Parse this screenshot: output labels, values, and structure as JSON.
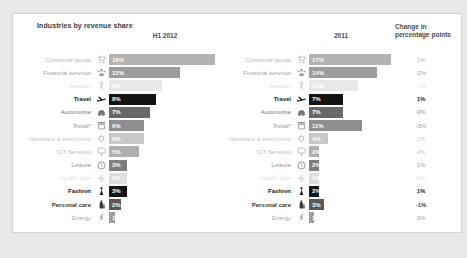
{
  "page": {
    "background": "#e9e9e9",
    "panel_background": "#ffffff",
    "panel_border": "#d2d2d2"
  },
  "title": "Industries by revenue share",
  "headers": {
    "col_2012": "H1 2012",
    "col_2011": "2011",
    "change_line1": "Change in",
    "change_line2": "percentage points"
  },
  "rows": [
    {
      "label": "Consumer goods",
      "icon": "cart",
      "value_2012": "18%",
      "pct_2012": 18,
      "value_2011": "17%",
      "pct_2011": 17,
      "change": "1%",
      "bar_color": "#b3b3b3",
      "label_color": "#b6b6b6",
      "change_color": "#b6b6b6",
      "emphasis": false
    },
    {
      "label": "Financial services",
      "icon": "people",
      "value_2012": "12%",
      "pct_2012": 12,
      "value_2011": "14%",
      "pct_2011": 14,
      "change": "-2%",
      "bar_color": "#9c9c9c",
      "label_color": "#a4a4a4",
      "change_color": "#a2a2a2",
      "emphasis": false
    },
    {
      "label": "Telecom",
      "icon": "phone",
      "value_2012": "9%",
      "pct_2012": 9,
      "value_2011": "10%",
      "pct_2011": 10,
      "change": "-1%",
      "bar_color": "#e8e8e8",
      "label_color": "#dddddd",
      "change_color": "#e0e0e0",
      "emphasis": false
    },
    {
      "label": "Travel",
      "icon": "plane",
      "value_2012": "8%",
      "pct_2012": 8,
      "value_2011": "7%",
      "pct_2011": 7,
      "change": "1%",
      "bar_color": "#131313",
      "label_color": "#1a1a1a",
      "change_color": "#1a1a1a",
      "emphasis": true
    },
    {
      "label": "Automotive",
      "icon": "car",
      "value_2012": "7%",
      "pct_2012": 7,
      "value_2011": "7%",
      "pct_2011": 7,
      "change": "0%",
      "bar_color": "#686868",
      "label_color": "#787878",
      "change_color": "#8a8a8a",
      "emphasis": false
    },
    {
      "label": "Retail*",
      "icon": "store",
      "value_2012": "6%",
      "pct_2012": 6,
      "value_2011": "11%",
      "pct_2011": 11,
      "change": "-5%",
      "bar_color": "#8e8e8e",
      "label_color": "#9a9a9a",
      "change_color": "#9b9b9b",
      "emphasis": false
    },
    {
      "label": "Hardware & electronics",
      "icon": "gear",
      "value_2012": "6%",
      "pct_2012": 6,
      "value_2011": "4%",
      "pct_2011": 4,
      "change": "2%",
      "bar_color": "#c8c8c8",
      "label_color": "#c9c9c9",
      "change_color": "#cacaca",
      "emphasis": false
    },
    {
      "label": "ICT Services",
      "icon": "monitor",
      "value_2012": "5%",
      "pct_2012": 5,
      "value_2011": "2%",
      "pct_2011": 2,
      "change": "3%",
      "bar_color": "#b0b0b0",
      "label_color": "#bdbdbd",
      "change_color": "#c2c2c2",
      "emphasis": false
    },
    {
      "label": "Leisure",
      "icon": "clock",
      "value_2012": "3%",
      "pct_2012": 3,
      "value_2011": "2%",
      "pct_2011": 2,
      "change": "1%",
      "bar_color": "#7e7e7e",
      "label_color": "#8f8f8f",
      "change_color": "#9e9e9e",
      "emphasis": false
    },
    {
      "label": "Health care",
      "icon": "cross",
      "value_2012": "3%",
      "pct_2012": 3,
      "value_2011": "2%",
      "pct_2011": 2,
      "change": "1%",
      "bar_color": "#dfdfdf",
      "label_color": "#dfdfdf",
      "change_color": "#dedede",
      "emphasis": false
    },
    {
      "label": "Fashion",
      "icon": "person",
      "value_2012": "3%",
      "pct_2012": 3,
      "value_2011": "2%",
      "pct_2011": 2,
      "change": "1%",
      "bar_color": "#161616",
      "label_color": "#1a1a1a",
      "change_color": "#1a1a1a",
      "emphasis": true
    },
    {
      "label": "Personal care",
      "icon": "bottle",
      "value_2012": "2%",
      "pct_2012": 2,
      "value_2011": "3%",
      "pct_2011": 3,
      "change": "-1%",
      "bar_color": "#595959",
      "label_color": "#3a3a3a",
      "change_color": "#3c3c3c",
      "emphasis": true
    },
    {
      "label": "Energy",
      "icon": "bolt",
      "value_2012": "1%",
      "pct_2012": 1,
      "value_2011": "1%",
      "pct_2011": 1,
      "change": "0%",
      "bar_color": "#9c9c9c",
      "label_color": "#a8a8a8",
      "change_color": "#a6a6a6",
      "emphasis": false
    }
  ],
  "chart_data": {
    "type": "bar",
    "orientation": "horizontal",
    "title": "Industries by revenue share",
    "categories": [
      "Consumer goods",
      "Financial services",
      "Telecom",
      "Travel",
      "Automotive",
      "Retail*",
      "Hardware & electronics",
      "ICT Services",
      "Leisure",
      "Health care",
      "Fashion",
      "Personal care",
      "Energy"
    ],
    "series": [
      {
        "name": "H1 2012",
        "values": [
          18,
          12,
          9,
          8,
          7,
          6,
          6,
          5,
          3,
          3,
          3,
          2,
          1
        ]
      },
      {
        "name": "2011",
        "values": [
          17,
          14,
          10,
          7,
          7,
          11,
          4,
          2,
          2,
          2,
          2,
          3,
          1
        ]
      }
    ],
    "changes_pp": [
      1,
      -2,
      -1,
      1,
      0,
      -5,
      2,
      3,
      1,
      1,
      1,
      -1,
      0
    ],
    "value_suffix": "%",
    "value_labels_inside_bars": true,
    "grid": false,
    "legend_position": "column-headers",
    "emphasized_categories": [
      "Travel",
      "Fashion",
      "Personal care"
    ]
  }
}
